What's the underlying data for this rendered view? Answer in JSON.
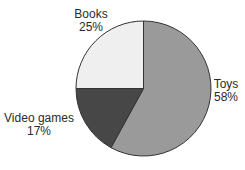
{
  "chart_data": {
    "type": "pie",
    "title": "",
    "categories": [
      "Toys",
      "Video games",
      "Books"
    ],
    "values": [
      58,
      17,
      25
    ],
    "unit": "%",
    "colors": [
      "#9a9a9a",
      "#474747",
      "#efefef"
    ],
    "outline_color": "#333333",
    "start_angle": "12 o'clock",
    "direction": "clockwise",
    "legend": "none (direct labels)",
    "labels": [
      {
        "name": "Toys",
        "value": "58%"
      },
      {
        "name": "Video games",
        "value": "17%"
      },
      {
        "name": "Books",
        "value": "25%"
      }
    ]
  }
}
